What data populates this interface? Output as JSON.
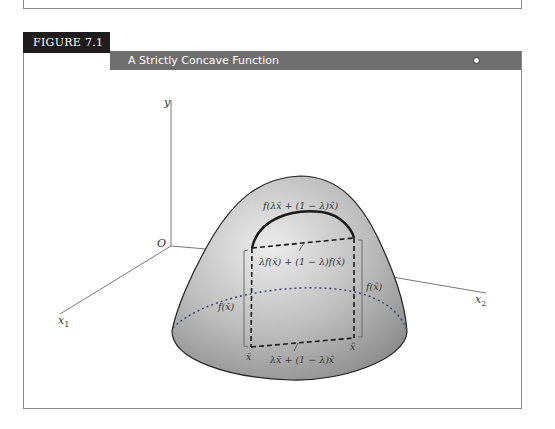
{
  "figure": {
    "tag": "FIGURE 7.1",
    "title": "A Strictly Concave Function"
  },
  "axes": {
    "y_label": "y",
    "origin_label": "O",
    "x1_label": "x",
    "x1_sub": "1",
    "x2_label": "x",
    "x2_sub": "2"
  },
  "annotations": {
    "f_of_combo": "f(λx̄ + (1 − λ)x̂)",
    "combo_of_f": "λf(x̄) + (1 − λ)f(x̂)",
    "f_xbar": "f(x̄)",
    "f_xhat": "f(x̂)",
    "xbar": "x̄",
    "xhat": "x̂",
    "combo_x": "λx̄ + (1 − λ)x̂"
  },
  "colors": {
    "header_dark": "#1e1c1c",
    "header_bar": "#6e6e6e",
    "surface_light": "#e6e6e6",
    "surface_dark": "#8c8c8c",
    "dotted_base": "#3a3a7a"
  }
}
